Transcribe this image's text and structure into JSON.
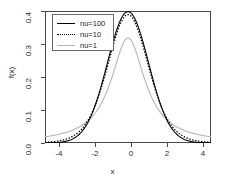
{
  "chart_data": {
    "type": "line",
    "title": "",
    "subtitle": "",
    "xlabel": "x",
    "ylabel": "f(x)",
    "xlim": [
      -4,
      4
    ],
    "ylim": [
      0.0,
      0.4
    ],
    "grid": false,
    "legend_position": "top-left",
    "xticks": [
      "-4",
      "-2",
      "0",
      "2",
      "4"
    ],
    "xtick_values": [
      -4,
      -2,
      0,
      2,
      4
    ],
    "yticks": [
      "0.0",
      "0.1",
      "0.2",
      "0.3",
      "0.4"
    ],
    "ytick_values": [
      0.0,
      0.1,
      0.2,
      0.3,
      0.4
    ],
    "x": [
      -4.0,
      -3.8,
      -3.6,
      -3.4,
      -3.2,
      -3.0,
      -2.8,
      -2.6,
      -2.4,
      -2.2,
      -2.0,
      -1.8,
      -1.6,
      -1.4,
      -1.2,
      -1.0,
      -0.8,
      -0.6,
      -0.4,
      -0.2,
      0.0,
      0.2,
      0.4,
      0.6,
      0.8,
      1.0,
      1.2,
      1.4,
      1.6,
      1.8,
      2.0,
      2.2,
      2.4,
      2.6,
      2.8,
      3.0,
      3.2,
      3.4,
      3.6,
      3.8,
      4.0
    ],
    "series": [
      {
        "name": "nu=100",
        "label": "nu=100",
        "style": "solid",
        "color": "#000000",
        "peak": 0.397,
        "values": [
          0.000169,
          0.000318,
          0.000586,
          0.001056,
          0.001862,
          0.003207,
          0.005404,
          0.008899,
          0.014325,
          0.022525,
          0.034607,
          0.051936,
          0.076043,
          0.108461,
          0.150468,
          0.202743,
          0.265012,
          0.335644,
          0.411268,
          0.486542,
          0.397013,
          0.486542,
          0.411268,
          0.335644,
          0.265012,
          0.202743,
          0.150468,
          0.108461,
          0.076043,
          0.051936,
          0.034607,
          0.022525,
          0.014325,
          0.008899,
          0.005404,
          0.003207,
          0.001862,
          0.001056,
          0.000586,
          0.000318,
          0.000169
        ]
      },
      {
        "name": "nu=10",
        "label": "nu=10",
        "style": "dotted",
        "color": "#000000",
        "peak": 0.389,
        "values": [
          0.002031,
          0.002819,
          0.003958,
          0.005627,
          0.008112,
          0.0114,
          0.016256,
          0.023236,
          0.033382,
          0.048044,
          0.065688,
          0.088506,
          0.11696,
          0.151105,
          0.190384,
          0.233349,
          0.277919,
          0.321219,
          0.359847,
          0.38124,
          0.389108,
          0.38124,
          0.359847,
          0.321219,
          0.277919,
          0.233349,
          0.190384,
          0.151105,
          0.11696,
          0.088506,
          0.065688,
          0.048044,
          0.033382,
          0.023236,
          0.016256,
          0.0114,
          0.008112,
          0.005627,
          0.003958,
          0.002819,
          0.002031
        ]
      },
      {
        "name": "nu=1",
        "label": "nu=1",
        "style": "solid",
        "color": "#b5b5b5",
        "peak": 0.318,
        "values": [
          0.018724,
          0.020666,
          0.022936,
          0.025614,
          0.028806,
          0.031831,
          0.036205,
          0.041472,
          0.0478,
          0.055467,
          0.063662,
          0.074432,
          0.08676,
          0.101321,
          0.118416,
          0.159155,
          0.194091,
          0.234051,
          0.274405,
          0.306068,
          0.31831,
          0.306068,
          0.274405,
          0.234051,
          0.194091,
          0.159155,
          0.118416,
          0.101321,
          0.08676,
          0.074432,
          0.063662,
          0.055467,
          0.0478,
          0.041472,
          0.036205,
          0.031831,
          0.028806,
          0.025614,
          0.022936,
          0.020666,
          0.018724
        ]
      }
    ]
  },
  "axes": {
    "x_title": "x",
    "y_title": "f(x)"
  },
  "legend": {
    "entries": [
      {
        "label": "nu=100",
        "style": "solid",
        "color": "#000000"
      },
      {
        "label": "nu=10",
        "style": "dotted",
        "color": "#000000"
      },
      {
        "label": "nu=1",
        "style": "solid",
        "color": "#b5b5b5"
      }
    ]
  },
  "colors": {
    "frame": "#4a4a4a",
    "text": "#2b2b2b",
    "curve_dark": "#000000",
    "curve_light": "#b5b5b5",
    "background": "#ffffff"
  }
}
